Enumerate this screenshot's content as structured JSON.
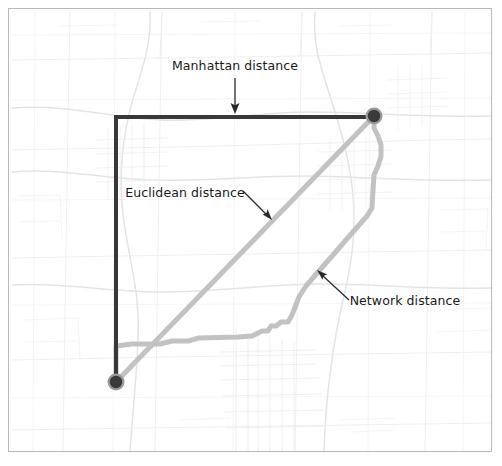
{
  "figure": {
    "type": "map-diagram",
    "title_visible": false,
    "background_color": "#ffffff",
    "border_color": "#b9b9b9",
    "frame": {
      "x": 8,
      "y": 8,
      "width": 484,
      "height": 444
    }
  },
  "basemap": {
    "description": "faint light-grey street and road network of a metropolitan region",
    "road_color": "#e8e8e8",
    "road_color_minor": "#f0f0f0",
    "road_color_major": "#dedede"
  },
  "annotations": [
    {
      "id": "manhattan",
      "label": "Manhattan distance",
      "label_x": 235,
      "label_y": 70,
      "text_anchor": "middle",
      "arrow_from": [
        235,
        78
      ],
      "arrow_to": [
        235,
        113
      ],
      "arrow_color": "#2b2b2b"
    },
    {
      "id": "euclidean",
      "label": "Euclidean distance",
      "label_x": 185,
      "label_y": 197,
      "text_anchor": "middle",
      "arrow_from": [
        243,
        191
      ],
      "arrow_to": [
        271,
        219
      ],
      "arrow_color": "#2b2b2b"
    },
    {
      "id": "network",
      "label": "Network distance",
      "label_x": 405,
      "label_y": 305,
      "text_anchor": "middle",
      "arrow_from": [
        349,
        300
      ],
      "arrow_to": [
        318,
        271
      ],
      "arrow_color": "#2b2b2b"
    }
  ],
  "nodes": [
    {
      "id": "origin",
      "name": "origin-node",
      "x": 116,
      "y": 382,
      "radius": 8.5,
      "fill": "#3a3a3a",
      "ring": "#8c8c8c"
    },
    {
      "id": "destination",
      "name": "destination-node",
      "x": 374,
      "y": 116,
      "radius": 8.5,
      "fill": "#3a3a3a",
      "ring": "#8c8c8c"
    }
  ],
  "chart_data": {
    "type": "line",
    "xlabel": "",
    "ylabel": "",
    "grid": false,
    "legend_position": "inline-annotations",
    "series": [
      {
        "name": "Manhattan distance",
        "color": "#383838",
        "width": 4.0,
        "points": [
          [
            116,
            382
          ],
          [
            116,
            117
          ],
          [
            374,
            117
          ]
        ]
      },
      {
        "name": "Euclidean distance",
        "color": "#c2c2c2",
        "width": 5.0,
        "points": [
          [
            116,
            382
          ],
          [
            374,
            116
          ]
        ]
      },
      {
        "name": "Network distance",
        "color": "#c2c2c2",
        "width": 5.0,
        "points": [
          [
            116,
            382
          ],
          [
            116,
            346
          ],
          [
            132,
            344
          ],
          [
            160,
            344
          ],
          [
            172,
            341
          ],
          [
            188,
            341
          ],
          [
            199,
            338
          ],
          [
            238,
            337
          ],
          [
            252,
            336
          ],
          [
            262,
            331
          ],
          [
            268,
            331
          ],
          [
            271,
            326
          ],
          [
            276,
            326
          ],
          [
            281,
            322
          ],
          [
            288,
            322
          ],
          [
            292,
            315
          ],
          [
            299,
            297
          ],
          [
            306,
            286
          ],
          [
            318,
            272
          ],
          [
            333,
            255
          ],
          [
            352,
            233
          ],
          [
            367,
            216
          ],
          [
            372,
            208
          ],
          [
            373,
            190
          ],
          [
            374,
            175
          ],
          [
            378,
            166
          ],
          [
            381,
            156
          ],
          [
            381,
            145
          ],
          [
            378,
            136
          ],
          [
            374,
            128
          ],
          [
            374,
            116
          ]
        ]
      }
    ]
  }
}
